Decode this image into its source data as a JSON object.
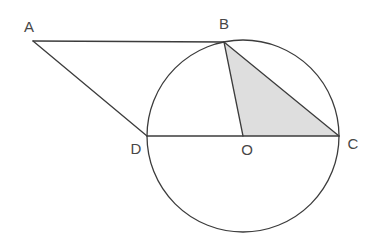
{
  "figure": {
    "type": "geometry-diagram",
    "background_color": "#ffffff",
    "stroke_color": "#3c3c3c",
    "label_color": "#474747",
    "shade_color": "#dedede",
    "circle": {
      "cx": 243,
      "cy": 136,
      "r": 96
    },
    "points": {
      "A": {
        "label": "A",
        "x": 33,
        "y": 41,
        "label_x": 29,
        "label_y": 32
      },
      "B": {
        "label": "B",
        "x": 224,
        "y": 42,
        "label_x": 224,
        "label_y": 29
      },
      "C": {
        "label": "C",
        "x": 339,
        "y": 136,
        "label_x": 353,
        "label_y": 149
      },
      "D": {
        "label": "D",
        "x": 147,
        "y": 136,
        "label_x": 136,
        "label_y": 154
      },
      "O": {
        "label": "O",
        "x": 243,
        "y": 136,
        "label_x": 247,
        "label_y": 155
      }
    },
    "segments": [
      {
        "from": "A",
        "to": "B"
      },
      {
        "from": "A",
        "to": "D"
      },
      {
        "from": "D",
        "to": "C"
      },
      {
        "from": "B",
        "to": "O"
      },
      {
        "from": "B",
        "to": "C"
      }
    ],
    "shaded_region": {
      "vertices": [
        "B",
        "O",
        "C"
      ]
    }
  }
}
